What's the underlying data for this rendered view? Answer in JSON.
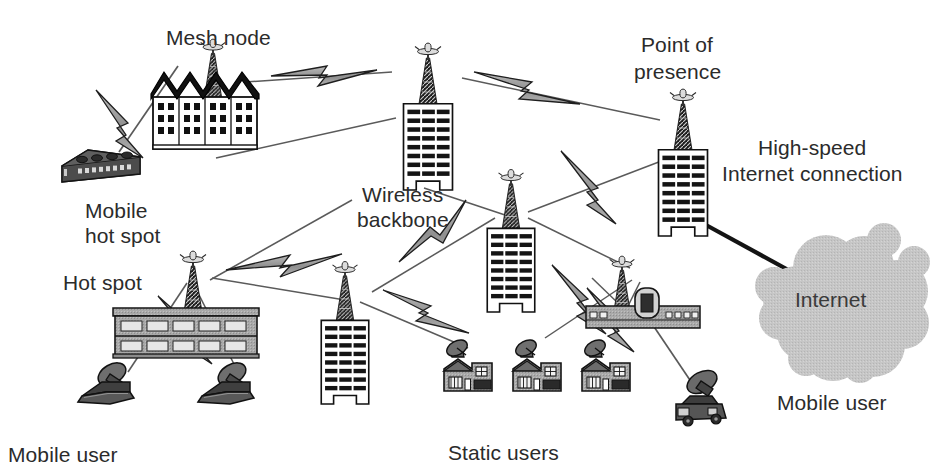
{
  "diagram": {
    "canvas": {
      "width": 947,
      "height": 476,
      "background": "#ffffff"
    },
    "palette": {
      "text": "#2b2b2b",
      "outline": "#000000",
      "bolt_fill": "#9a9a9a",
      "cloud_fill": "#c3c3c3",
      "building_light": "#ffffff",
      "building_gray": "#a8a8a8",
      "device_dark": "#4a4a4a",
      "link_line": "#555555",
      "internet_line": "#1a1a1a"
    },
    "labels": {
      "mesh_node": "Mesh node",
      "mobile_hot_spot_line1": "Mobile",
      "mobile_hot_spot_line2": "hot spot",
      "wireless_backbone_line1": "Wireless",
      "wireless_backbone_line2": "backbone",
      "point_of_presence_line1": "Point of",
      "point_of_presence_line2": "presence",
      "high_speed_line1": "High-speed",
      "high_speed_line2": "Internet connection",
      "internet": "Internet",
      "hot_spot": "Hot spot",
      "mobile_user_left": "Mobile user",
      "mobile_user_right": "Mobile user",
      "static_users": "Static users"
    },
    "nodes": [
      {
        "id": "mobile-hot-spot",
        "kind": "vehicle-box",
        "label": "Mobile hot spot",
        "x": 100,
        "y": 160
      },
      {
        "id": "mesh-node",
        "kind": "factory-with-tower",
        "label": "Mesh node",
        "x": 205,
        "y": 125
      },
      {
        "id": "wireless-backbone",
        "kind": "tower-building",
        "label": "Wireless backbone",
        "x": 428,
        "y": 145
      },
      {
        "id": "point-of-presence",
        "kind": "tower-building",
        "label": "Point of presence",
        "x": 683,
        "y": 185
      },
      {
        "id": "relay-building",
        "kind": "tower-building",
        "label": "",
        "x": 510,
        "y": 265
      },
      {
        "id": "hot-spot",
        "kind": "wide-building-tower",
        "label": "Hot spot",
        "x": 185,
        "y": 320
      },
      {
        "id": "low-building",
        "kind": "tower-building",
        "label": "",
        "x": 345,
        "y": 345
      },
      {
        "id": "router-rack",
        "kind": "rack-with-tower",
        "label": "",
        "x": 640,
        "y": 310
      },
      {
        "id": "static-user-1",
        "kind": "house-dish",
        "label": "Static users",
        "x": 468,
        "y": 375
      },
      {
        "id": "static-user-2",
        "kind": "house-dish",
        "label": "Static users",
        "x": 536,
        "y": 375
      },
      {
        "id": "static-user-3",
        "kind": "house-dish",
        "label": "Static users",
        "x": 604,
        "y": 375
      },
      {
        "id": "mobile-user-laptop-1",
        "kind": "laptop-dish",
        "label": "Mobile user",
        "x": 108,
        "y": 388
      },
      {
        "id": "mobile-user-laptop-2",
        "kind": "laptop-dish",
        "label": "Mobile user",
        "x": 228,
        "y": 388
      },
      {
        "id": "mobile-user-car",
        "kind": "car-dish",
        "label": "Mobile user",
        "x": 700,
        "y": 406
      },
      {
        "id": "internet-cloud",
        "kind": "cloud",
        "label": "Internet",
        "x": 845,
        "y": 300
      }
    ],
    "links": [
      {
        "from": "mobile-hot-spot",
        "to": "mesh-node",
        "type": "wireless"
      },
      {
        "from": "mesh-node",
        "to": "wireless-backbone",
        "type": "wireless"
      },
      {
        "from": "wireless-backbone",
        "to": "point-of-presence",
        "type": "wireless"
      },
      {
        "from": "mesh-node",
        "to": "hot-spot",
        "type": "wireless"
      },
      {
        "from": "wireless-backbone",
        "to": "relay-building",
        "type": "wireless"
      },
      {
        "from": "relay-building",
        "to": "point-of-presence",
        "type": "wireless"
      },
      {
        "from": "relay-building",
        "to": "router-rack",
        "type": "wireless"
      },
      {
        "from": "relay-building",
        "to": "low-building",
        "type": "wireless"
      },
      {
        "from": "hot-spot",
        "to": "low-building",
        "type": "wireless"
      },
      {
        "from": "low-building",
        "to": "static-user-1",
        "type": "wireless"
      },
      {
        "from": "router-rack",
        "to": "static-user-2",
        "type": "wireless"
      },
      {
        "from": "router-rack",
        "to": "static-user-3",
        "type": "wireless"
      },
      {
        "from": "router-rack",
        "to": "mobile-user-car",
        "type": "wireless"
      },
      {
        "from": "hot-spot",
        "to": "mobile-user-laptop-1",
        "type": "wireless"
      },
      {
        "from": "hot-spot",
        "to": "mobile-user-laptop-2",
        "type": "wireless"
      },
      {
        "from": "point-of-presence",
        "to": "internet-cloud",
        "type": "high-speed-wired"
      }
    ]
  }
}
